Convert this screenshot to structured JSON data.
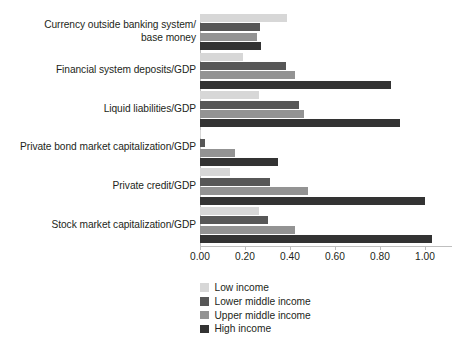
{
  "chart_data": {
    "type": "bar",
    "orientation": "horizontal",
    "title": "",
    "xlabel": "",
    "ylabel": "",
    "xlim": [
      0.0,
      1.12
    ],
    "grid": false,
    "legend_position": "bottom-center",
    "xticks": [
      0.0,
      0.2,
      0.4,
      0.6,
      0.8,
      1.0
    ],
    "xtick_labels": [
      "0.00",
      "0.20",
      "0.40",
      "0.60",
      "0.80",
      "1.00"
    ],
    "categories": [
      "Currency outside banking system/\nbase money",
      "Financial system deposits/GDP",
      "Liquid liabilities/GDP",
      "Private bond market capitalization/GDP",
      "Private credit/GDP",
      "Stock market capitalization/GDP"
    ],
    "category_lines": [
      [
        "Currency outside banking system/",
        "base money"
      ],
      [
        "Financial system deposits/GDP"
      ],
      [
        "Liquid liabilities/GDP"
      ],
      [
        "Private bond market capitalization/GDP"
      ],
      [
        "Private credit/GDP"
      ],
      [
        "Stock market capitalization/GDP"
      ]
    ],
    "series": [
      {
        "name": "Low income",
        "color": "#d7d7d7",
        "values": [
          0.385,
          0.19,
          0.26,
          0.005,
          0.135,
          0.26
        ]
      },
      {
        "name": "Lower middle income",
        "color": "#575757",
        "values": [
          0.268,
          0.38,
          0.44,
          0.02,
          0.31,
          0.3
        ]
      },
      {
        "name": "Upper middle income",
        "color": "#939393",
        "values": [
          0.253,
          0.42,
          0.462,
          0.155,
          0.48,
          0.42
        ]
      },
      {
        "name": "High income",
        "color": "#333333",
        "values": [
          0.272,
          0.85,
          0.89,
          0.345,
          1.0,
          1.032
        ]
      }
    ]
  },
  "legend": {
    "items": [
      {
        "label": "Low income",
        "color": "#d7d7d7",
        "swatch": "legend-swatch-low-income"
      },
      {
        "label": "Lower middle income",
        "color": "#575757",
        "swatch": "legend-swatch-lower-middle-income"
      },
      {
        "label": "Upper middle income",
        "color": "#939393",
        "swatch": "legend-swatch-upper-middle-income"
      },
      {
        "label": "High income",
        "color": "#333333",
        "swatch": "legend-swatch-high-income"
      }
    ]
  },
  "axis": {
    "baseline_color": "#bfbfbf",
    "tick_color": "#bfbfbf",
    "text_color": "#231f20"
  }
}
